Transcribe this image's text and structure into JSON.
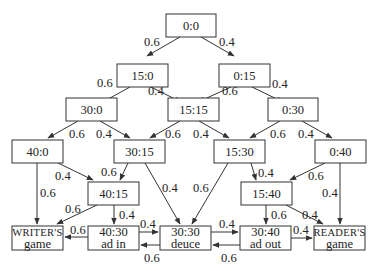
{
  "diagram": {
    "nodes": [
      {
        "id": "n00",
        "lines": [
          "0:0"
        ],
        "x": 166,
        "y": 14,
        "w": 50,
        "h": 23
      },
      {
        "id": "n150",
        "lines": [
          "15:0"
        ],
        "x": 117,
        "y": 64,
        "w": 51,
        "h": 23
      },
      {
        "id": "n015",
        "lines": [
          "0:15"
        ],
        "x": 219,
        "y": 64,
        "w": 51,
        "h": 23
      },
      {
        "id": "n300",
        "lines": [
          "30:0"
        ],
        "x": 66,
        "y": 98,
        "w": 51,
        "h": 23
      },
      {
        "id": "n1515",
        "lines": [
          "15:15"
        ],
        "x": 168,
        "y": 98,
        "w": 51,
        "h": 23
      },
      {
        "id": "n030",
        "lines": [
          "0:30"
        ],
        "x": 268,
        "y": 98,
        "w": 50,
        "h": 23
      },
      {
        "id": "n400",
        "lines": [
          "40:0"
        ],
        "x": 12,
        "y": 140,
        "w": 51,
        "h": 23
      },
      {
        "id": "n3015",
        "lines": [
          "30:15"
        ],
        "x": 114,
        "y": 140,
        "w": 51,
        "h": 23
      },
      {
        "id": "n1530",
        "lines": [
          "15:30"
        ],
        "x": 214,
        "y": 140,
        "w": 51,
        "h": 23
      },
      {
        "id": "n040",
        "lines": [
          "0:40"
        ],
        "x": 315,
        "y": 140,
        "w": 51,
        "h": 23
      },
      {
        "id": "n4015",
        "lines": [
          "40:15"
        ],
        "x": 88,
        "y": 182,
        "w": 51,
        "h": 23
      },
      {
        "id": "n1540",
        "lines": [
          "15:40"
        ],
        "x": 241,
        "y": 182,
        "w": 51,
        "h": 23
      },
      {
        "id": "wg",
        "lines": [
          "Writer's",
          "game"
        ],
        "smallcaps": true,
        "x": 12,
        "y": 226,
        "w": 51,
        "h": 24
      },
      {
        "id": "adin",
        "lines": [
          "40:30",
          "ad in"
        ],
        "x": 88,
        "y": 226,
        "w": 51,
        "h": 24
      },
      {
        "id": "deuce",
        "lines": [
          "30:30",
          "deuce"
        ],
        "x": 160,
        "y": 226,
        "w": 51,
        "h": 24
      },
      {
        "id": "adout",
        "lines": [
          "30:40",
          "ad out"
        ],
        "x": 240,
        "y": 226,
        "w": 51,
        "h": 24
      },
      {
        "id": "rg",
        "lines": [
          "Reader's",
          "game"
        ],
        "smallcaps": true,
        "x": 314,
        "y": 226,
        "w": 51,
        "h": 24
      }
    ],
    "edges": [
      {
        "from": "n00",
        "to": "n150",
        "label": "0.6",
        "x1": 180,
        "y1": 37,
        "x2": 147,
        "y2": 56,
        "lx": 144,
        "ly": 46
      },
      {
        "from": "n00",
        "to": "n015",
        "label": "0.4",
        "x1": 201,
        "y1": 37,
        "x2": 234,
        "y2": 56,
        "lx": 219,
        "ly": 46
      },
      {
        "from": "n150",
        "to": "n300",
        "label": "0.6",
        "x1": 130,
        "y1": 87,
        "x2": 101,
        "y2": 103,
        "lx": 97,
        "ly": 87
      },
      {
        "from": "n150",
        "to": "n1515",
        "label": "0.4",
        "x1": 151,
        "y1": 87,
        "x2": 181,
        "y2": 102,
        "lx": 148,
        "ly": 95
      },
      {
        "from": "n015",
        "to": "n1515",
        "label": "0.6",
        "x1": 231,
        "y1": 87,
        "x2": 198,
        "y2": 102,
        "lx": 222,
        "ly": 95
      },
      {
        "from": "n015",
        "to": "n030",
        "label": "0.4",
        "x1": 252,
        "y1": 87,
        "x2": 283,
        "y2": 102,
        "lx": 272,
        "ly": 88
      },
      {
        "from": "n300",
        "to": "n400",
        "label": "0.6",
        "x1": 78,
        "y1": 121,
        "x2": 48,
        "y2": 138,
        "lx": 69,
        "ly": 138
      },
      {
        "from": "n300",
        "to": "n3015",
        "label": "0.4",
        "x1": 100,
        "y1": 121,
        "x2": 130,
        "y2": 138,
        "lx": 96,
        "ly": 138
      },
      {
        "from": "n1515",
        "to": "n3015",
        "label": "0.6",
        "x1": 180,
        "y1": 121,
        "x2": 150,
        "y2": 138,
        "lx": 165,
        "ly": 138
      },
      {
        "from": "n1515",
        "to": "n1530",
        "label": "0.4",
        "x1": 199,
        "y1": 121,
        "x2": 229,
        "y2": 138,
        "lx": 193,
        "ly": 138
      },
      {
        "from": "n030",
        "to": "n1530",
        "label": "0.6",
        "x1": 280,
        "y1": 121,
        "x2": 250,
        "y2": 138,
        "lx": 270,
        "ly": 138
      },
      {
        "from": "n030",
        "to": "n040",
        "label": "0.4",
        "x1": 302,
        "y1": 121,
        "x2": 332,
        "y2": 138,
        "lx": 298,
        "ly": 138
      },
      {
        "from": "n400",
        "to": "wg",
        "label": "0.6",
        "x1": 37,
        "y1": 163,
        "x2": 37,
        "y2": 224,
        "lx": 40,
        "ly": 197
      },
      {
        "from": "n400",
        "to": "n4015",
        "label": "0.4",
        "x1": 58,
        "y1": 163,
        "x2": 93,
        "y2": 180,
        "lx": 55,
        "ly": 180
      },
      {
        "from": "n3015",
        "to": "n4015",
        "label": "0.6",
        "x1": 128,
        "y1": 163,
        "x2": 120,
        "y2": 180,
        "lx": 101,
        "ly": 176
      },
      {
        "from": "n3015",
        "to": "deuce",
        "label": "0.4",
        "x1": 145,
        "y1": 163,
        "x2": 180,
        "y2": 224,
        "lx": 162,
        "ly": 192
      },
      {
        "from": "n1530",
        "to": "deuce",
        "label": "0.6",
        "x1": 228,
        "y1": 163,
        "x2": 192,
        "y2": 224,
        "lx": 193,
        "ly": 192
      },
      {
        "from": "n1530",
        "to": "n1540",
        "label": "0.4",
        "x1": 251,
        "y1": 163,
        "x2": 256,
        "y2": 180,
        "lx": 258,
        "ly": 177
      },
      {
        "from": "n040",
        "to": "n1540",
        "label": "0.6",
        "x1": 325,
        "y1": 163,
        "x2": 290,
        "y2": 180,
        "lx": 308,
        "ly": 180
      },
      {
        "from": "n040",
        "to": "rg",
        "label": "0.4",
        "x1": 340,
        "y1": 163,
        "x2": 340,
        "y2": 224,
        "lx": 322,
        "ly": 197
      },
      {
        "from": "n4015",
        "to": "wg",
        "label": "0.6",
        "x1": 97,
        "y1": 205,
        "x2": 57,
        "y2": 224,
        "lx": 65,
        "ly": 213
      },
      {
        "from": "n4015",
        "to": "adin",
        "label": "0.4",
        "x1": 114,
        "y1": 205,
        "x2": 114,
        "y2": 224,
        "lx": 119,
        "ly": 219
      },
      {
        "from": "n1540",
        "to": "adout",
        "label": "0.6",
        "x1": 266,
        "y1": 205,
        "x2": 266,
        "y2": 224,
        "lx": 271,
        "ly": 219
      },
      {
        "from": "n1540",
        "to": "rg",
        "label": "0.4",
        "x1": 286,
        "y1": 205,
        "x2": 323,
        "y2": 224,
        "lx": 302,
        "ly": 219
      },
      {
        "from": "adin",
        "to": "wg",
        "label": "0.6",
        "x1": 88,
        "y1": 237,
        "x2": 65,
        "y2": 237,
        "lx": 70,
        "ly": 234
      },
      {
        "from": "adin",
        "to": "deuce",
        "label": "0.4",
        "x1": 139,
        "y1": 232,
        "x2": 158,
        "y2": 232,
        "lx": 140,
        "ly": 228
      },
      {
        "from": "deuce",
        "to": "adin",
        "label": "0.6",
        "x1": 160,
        "y1": 245,
        "x2": 141,
        "y2": 245,
        "lx": 144,
        "ly": 262
      },
      {
        "from": "deuce",
        "to": "adout",
        "label": "0.4",
        "x1": 211,
        "y1": 232,
        "x2": 238,
        "y2": 232,
        "lx": 219,
        "ly": 228
      },
      {
        "from": "adout",
        "to": "deuce",
        "label": "0.6",
        "x1": 240,
        "y1": 245,
        "x2": 213,
        "y2": 245,
        "lx": 221,
        "ly": 262
      },
      {
        "from": "adout",
        "to": "rg",
        "label": "0.4",
        "x1": 291,
        "y1": 238,
        "x2": 312,
        "y2": 238,
        "lx": 293,
        "ly": 234
      }
    ]
  }
}
